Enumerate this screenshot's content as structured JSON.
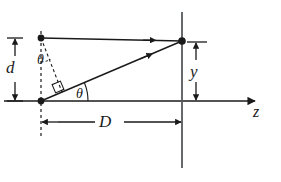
{
  "figure": {
    "axis": {
      "name": "z-axis",
      "label": "z",
      "arrow": "right-arrow-head"
    },
    "labels": {
      "slit_separation": "d",
      "screen_distance": "D",
      "fringe_position": "y",
      "angle_top": "θ",
      "angle_bottom": "θ"
    },
    "points": [
      {
        "name": "upper-slit-point",
        "x": 41,
        "y": 38
      },
      {
        "name": "lower-slit-point",
        "x": 41,
        "y": 101
      },
      {
        "name": "screen-point",
        "x": 182,
        "y": 41
      }
    ],
    "rays": [
      {
        "name": "upper-ray",
        "from": [
          41,
          38
        ],
        "to": [
          182,
          41
        ],
        "arrow_at": 0.78
      },
      {
        "name": "lower-ray",
        "from": [
          41,
          101
        ],
        "to": [
          182,
          41
        ],
        "arrow_at": 0.74
      }
    ],
    "dimensions": [
      {
        "name": "d-dimension",
        "orientation": "vertical",
        "x": 15,
        "y1": 38,
        "y2": 101
      },
      {
        "name": "y-dimension",
        "orientation": "vertical",
        "x": 196,
        "y1": 42,
        "y2": 101
      },
      {
        "name": "D-dimension",
        "orientation": "horizontal",
        "y": 122,
        "x1": 41,
        "x2": 182
      }
    ],
    "construction": [
      {
        "name": "dashed-vertical-through-slits",
        "from": [
          41,
          32
        ],
        "to": [
          41,
          136
        ]
      },
      {
        "name": "dashed-path-difference-line",
        "from": [
          41,
          38
        ],
        "to": [
          61,
          90
        ]
      },
      {
        "name": "right-angle-marker",
        "x": 58,
        "y": 86
      }
    ],
    "screen_line": {
      "name": "screen-line",
      "x": 182,
      "y1": 12,
      "y2": 168
    },
    "colors": {
      "ink": "#1a1a1a",
      "background": "#ffffff"
    }
  }
}
